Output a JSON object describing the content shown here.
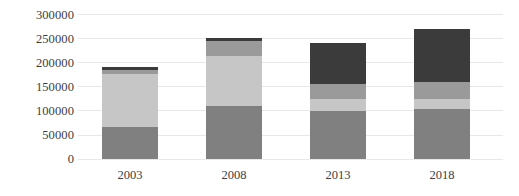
{
  "chart_data": {
    "type": "bar",
    "subtype": "stacked-bar",
    "title": "",
    "xlabel": "",
    "ylabel": "",
    "categories": [
      "2003",
      "2008",
      "2013",
      "2018"
    ],
    "ylim": [
      0,
      300000
    ],
    "ytick_values": [
      300000,
      250000,
      200000,
      150000,
      100000,
      50000,
      0
    ],
    "ytick_labels": [
      "300000",
      "250000",
      "200000",
      "150000",
      "100000",
      "50000",
      "0"
    ],
    "grid": true,
    "grid_axis": "y",
    "legend": "none",
    "series": [
      {
        "name": "segment-1",
        "color": "#808080",
        "values": [
          66000,
          111000,
          100000,
          104000
        ]
      },
      {
        "name": "segment-2",
        "color": "#c6c6c6",
        "values": [
          110000,
          103000,
          24000,
          20000
        ]
      },
      {
        "name": "segment-3",
        "color": "#9a9a9a",
        "values": [
          9000,
          31000,
          31000,
          35000
        ]
      },
      {
        "name": "segment-4",
        "color": "#3b3b3b",
        "values": [
          5000,
          6000,
          86000,
          111000
        ]
      }
    ],
    "totals": [
      190000,
      251000,
      241000,
      270000
    ]
  },
  "colors": {
    "background": "#ffffff",
    "gridline": "#e8e8e8",
    "text": "#3d3d3d",
    "segment_1": "#808080",
    "segment_2": "#c6c6c6",
    "segment_3": "#9a9a9a",
    "segment_4": "#3b3b3b"
  }
}
